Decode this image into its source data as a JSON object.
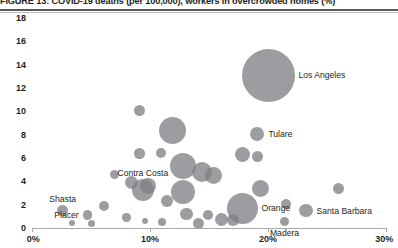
{
  "figure": {
    "title": "FIGURE 13: COVID-19 deaths (per 100,000), workers in overcrowded homes (%)"
  },
  "chart_data": {
    "type": "scatter",
    "title": "FIGURE 13: COVID-19 deaths (per 100,000), workers in overcrowded homes (%)",
    "xlabel": "",
    "ylabel": "",
    "xlim": [
      0,
      30
    ],
    "ylim": [
      0,
      18
    ],
    "grid": false,
    "legend": null,
    "bubble_color": "#808285",
    "bubble_opacity": 0.78,
    "x_ticks": [
      "0%",
      "10%",
      "20%",
      "30%"
    ],
    "x_tick_values": [
      0,
      10,
      20,
      30
    ],
    "y_ticks": [
      "0",
      "2",
      "4",
      "6",
      "8",
      "10",
      "12",
      "14",
      "16",
      "18"
    ],
    "y_tick_values": [
      0,
      2,
      4,
      6,
      8,
      10,
      12,
      14,
      16,
      18
    ],
    "size_note": "bubble area scales with county population",
    "points": [
      {
        "label": "Los Angeles",
        "x": 20.0,
        "y": 13.1,
        "r": 26.5,
        "label_pos": "right"
      },
      {
        "label": "Tulare",
        "x": 19.1,
        "y": 8.1,
        "r": 7.0,
        "label_pos": "right"
      },
      {
        "label": "Contra Costa",
        "x": 9.4,
        "y": 3.3,
        "r": 11.0,
        "label_pos": "above"
      },
      {
        "label": "Shasta",
        "x": 2.6,
        "y": 1.5,
        "r": 5.5,
        "label_pos": "above"
      },
      {
        "label": "Placer",
        "x": 4.7,
        "y": 1.1,
        "r": 4.8,
        "label_pos": "left"
      },
      {
        "label": "Orange",
        "x": 17.8,
        "y": 1.7,
        "r": 15.5,
        "label_pos": "right"
      },
      {
        "label": "Santa Barbara",
        "x": 23.2,
        "y": 1.5,
        "r": 6.8,
        "label_pos": "right"
      },
      {
        "label": "Madera",
        "x": 21.4,
        "y": 0.6,
        "r": 4.5,
        "label_pos": "below"
      },
      {
        "label": "",
        "x": 11.9,
        "y": 8.4,
        "r": 13.5,
        "label_pos": "none"
      },
      {
        "label": "",
        "x": 9.1,
        "y": 10.1,
        "r": 5.5,
        "label_pos": "none"
      },
      {
        "label": "",
        "x": 9.1,
        "y": 6.4,
        "r": 5.2,
        "label_pos": "none"
      },
      {
        "label": "",
        "x": 10.9,
        "y": 6.4,
        "r": 5.0,
        "label_pos": "none"
      },
      {
        "label": "",
        "x": 12.8,
        "y": 5.3,
        "r": 13.0,
        "label_pos": "none"
      },
      {
        "label": "",
        "x": 14.4,
        "y": 4.8,
        "r": 10.0,
        "label_pos": "none"
      },
      {
        "label": "",
        "x": 7.0,
        "y": 4.6,
        "r": 4.5,
        "label_pos": "none"
      },
      {
        "label": "",
        "x": 8.4,
        "y": 3.9,
        "r": 6.5,
        "label_pos": "none"
      },
      {
        "label": "",
        "x": 9.8,
        "y": 3.6,
        "r": 8.0,
        "label_pos": "none"
      },
      {
        "label": "",
        "x": 12.8,
        "y": 3.1,
        "r": 12.0,
        "label_pos": "none"
      },
      {
        "label": "",
        "x": 11.4,
        "y": 2.3,
        "r": 6.0,
        "label_pos": "none"
      },
      {
        "label": "",
        "x": 6.1,
        "y": 1.9,
        "r": 5.0,
        "label_pos": "none"
      },
      {
        "label": "",
        "x": 13.1,
        "y": 1.2,
        "r": 6.2,
        "label_pos": "none"
      },
      {
        "label": "",
        "x": 14.9,
        "y": 1.1,
        "r": 5.0,
        "label_pos": "none"
      },
      {
        "label": "",
        "x": 8.0,
        "y": 0.9,
        "r": 4.2,
        "label_pos": "none"
      },
      {
        "label": "",
        "x": 11.0,
        "y": 0.5,
        "r": 4.0,
        "label_pos": "none"
      },
      {
        "label": "",
        "x": 14.1,
        "y": 0.4,
        "r": 5.5,
        "label_pos": "none"
      },
      {
        "label": "",
        "x": 16.1,
        "y": 0.7,
        "r": 6.5,
        "label_pos": "none"
      },
      {
        "label": "",
        "x": 17.0,
        "y": 0.7,
        "r": 6.0,
        "label_pos": "none"
      },
      {
        "label": "",
        "x": 15.4,
        "y": 4.5,
        "r": 8.5,
        "label_pos": "none"
      },
      {
        "label": "",
        "x": 17.8,
        "y": 6.3,
        "r": 7.5,
        "label_pos": "none"
      },
      {
        "label": "",
        "x": 19.1,
        "y": 6.1,
        "r": 5.5,
        "label_pos": "none"
      },
      {
        "label": "",
        "x": 19.4,
        "y": 3.4,
        "r": 8.5,
        "label_pos": "none"
      },
      {
        "label": "",
        "x": 21.5,
        "y": 2.1,
        "r": 5.0,
        "label_pos": "none"
      },
      {
        "label": "",
        "x": 26.0,
        "y": 3.4,
        "r": 5.5,
        "label_pos": "none"
      },
      {
        "label": "",
        "x": 5.0,
        "y": 0.4,
        "r": 3.5,
        "label_pos": "none"
      },
      {
        "label": "",
        "x": 9.6,
        "y": 0.6,
        "r": 3.2,
        "label_pos": "none"
      },
      {
        "label": "",
        "x": 3.4,
        "y": 0.4,
        "r": 3.0,
        "label_pos": "none"
      }
    ]
  }
}
